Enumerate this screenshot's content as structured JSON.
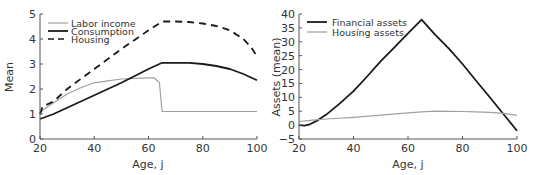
{
  "chart_data": [
    {
      "type": "line",
      "title": "",
      "xlabel": "Age, j",
      "ylabel": "Mean",
      "xlim": [
        20,
        100
      ],
      "ylim": [
        0,
        5
      ],
      "xticks": [
        20,
        40,
        60,
        80,
        100
      ],
      "yticks": [
        0,
        1,
        2,
        3,
        4,
        5
      ],
      "grid": false,
      "legend_position": "upper left",
      "series": [
        {
          "name": "Labor income",
          "style": "solid",
          "color": "#a0a0a0",
          "x": [
            20,
            21,
            25,
            30,
            35,
            40,
            45,
            50,
            55,
            60,
            62,
            64,
            65,
            70,
            80,
            90,
            100
          ],
          "y": [
            1.0,
            1.15,
            1.45,
            1.8,
            2.05,
            2.25,
            2.33,
            2.4,
            2.43,
            2.45,
            2.45,
            2.25,
            1.1,
            1.1,
            1.1,
            1.1,
            1.1
          ]
        },
        {
          "name": "Consumption",
          "style": "solid",
          "color": "#1a1a1a",
          "x": [
            20,
            25,
            30,
            40,
            50,
            60,
            65,
            70,
            75,
            80,
            85,
            90,
            95,
            100
          ],
          "y": [
            0.8,
            1.0,
            1.25,
            1.75,
            2.25,
            2.8,
            3.05,
            3.05,
            3.05,
            3.0,
            2.92,
            2.8,
            2.6,
            2.35
          ]
        },
        {
          "name": "Housing",
          "style": "dashed",
          "color": "#1a1a1a",
          "x": [
            20,
            21,
            25,
            30,
            40,
            50,
            60,
            65,
            70,
            75,
            80,
            85,
            90,
            95,
            98,
            100
          ],
          "y": [
            1.0,
            1.3,
            1.5,
            2.0,
            2.8,
            3.6,
            4.35,
            4.7,
            4.7,
            4.68,
            4.62,
            4.52,
            4.35,
            4.0,
            3.65,
            3.3
          ]
        }
      ]
    },
    {
      "type": "line",
      "title": "",
      "xlabel": "Age, j",
      "ylabel": "Assets (mean)",
      "xlim": [
        20,
        100
      ],
      "ylim": [
        -5,
        40
      ],
      "xticks": [
        20,
        40,
        60,
        80,
        100
      ],
      "yticks": [
        -5,
        0,
        5,
        10,
        15,
        20,
        25,
        30,
        35,
        40
      ],
      "grid": false,
      "legend_position": "upper left",
      "series": [
        {
          "name": "Financial assets",
          "style": "solid",
          "color": "#1a1a1a",
          "x": [
            20,
            22,
            24,
            27,
            30,
            35,
            40,
            45,
            50,
            55,
            60,
            65,
            70,
            75,
            80,
            85,
            90,
            95,
            100
          ],
          "y": [
            0.0,
            -0.2,
            0.3,
            1.8,
            3.8,
            7.8,
            12.2,
            17.5,
            23.0,
            28.0,
            33.0,
            38.0,
            32.5,
            27.5,
            22.0,
            16.0,
            10.0,
            4.0,
            -2.0
          ]
        },
        {
          "name": "Housing assets",
          "style": "solid",
          "color": "#a0a0a0",
          "x": [
            20,
            25,
            30,
            40,
            50,
            60,
            65,
            70,
            80,
            85,
            90,
            95,
            100
          ],
          "y": [
            1.3,
            1.8,
            2.2,
            2.8,
            3.6,
            4.4,
            4.8,
            5.0,
            4.9,
            4.8,
            4.6,
            4.2,
            3.5
          ]
        }
      ]
    }
  ],
  "left_panel": {
    "ylabel": "Mean",
    "xlabel": "Age, j",
    "yticks": [
      "0",
      "1",
      "2",
      "3",
      "4",
      "5"
    ],
    "xticks": [
      "20",
      "40",
      "60",
      "80",
      "100"
    ],
    "legend": [
      "Labor income",
      "Consumption",
      "Housing"
    ]
  },
  "right_panel": {
    "ylabel": "Assets (mean)",
    "xlabel": "Age, j",
    "yticks": [
      "−5",
      "0",
      "5",
      "10",
      "15",
      "20",
      "25",
      "30",
      "35",
      "40"
    ],
    "xticks": [
      "20",
      "40",
      "60",
      "80",
      "100"
    ],
    "legend": [
      "Financial assets",
      "Housing assets"
    ]
  }
}
